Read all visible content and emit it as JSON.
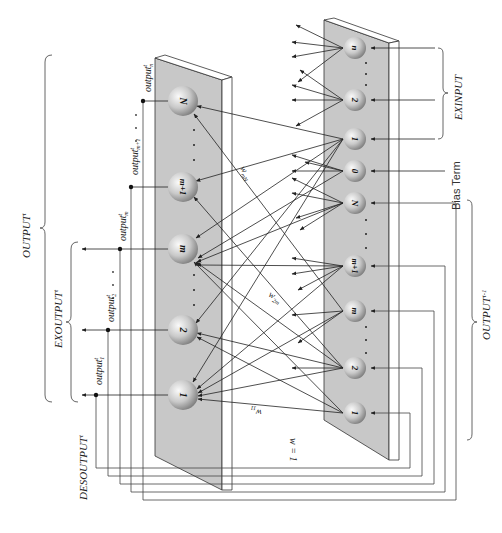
{
  "diagram": {
    "type": "recurrent-neural-network-schematic",
    "colors": {
      "panel_fill": "#c8c8c8",
      "panel_edge": "#333333",
      "node_fill_light": "#f4f4f4",
      "node_fill_dark": "#8c8c8c",
      "line": "#222222"
    },
    "labels": {
      "output_t": "OUTPUT",
      "output_t_sup": "t",
      "exoutput_t": "EXOUTPUT",
      "exoutput_t_sup": "t",
      "desoutput_t": "DESOUTPUT",
      "desoutput_t_sup": "t",
      "output_t_minus_1": "OUTPUT",
      "output_t_minus_1_sup": "t-1",
      "exinput": "EXINPUT",
      "bias_term": "Bias Term",
      "w_equals_1": "w = 1",
      "w_11": "w",
      "w_11_sub": "11",
      "w_2m": "w",
      "w_2m_sub": "2m",
      "w_mN": "w",
      "w_mN_sub": "mN"
    },
    "output_labels": [
      {
        "base": "output",
        "sup": "t",
        "sub": "n"
      },
      {
        "base": "output",
        "sup": "t",
        "sub": "m+1"
      },
      {
        "base": "output",
        "sup": "t",
        "sub": "m"
      },
      {
        "base": "output",
        "sup": "t",
        "sub": "2"
      },
      {
        "base": "output",
        "sup": "t",
        "sub": "1"
      }
    ],
    "output_layer_nodes": [
      {
        "label": "N"
      },
      {
        "label": "m+1"
      },
      {
        "label": "m"
      },
      {
        "label": "2"
      },
      {
        "label": "1"
      }
    ],
    "input_layer_nodes": [
      {
        "label": "n",
        "group": "EXINPUT"
      },
      {
        "label": "2",
        "group": "EXINPUT"
      },
      {
        "label": "1",
        "group": "EXINPUT"
      },
      {
        "label": "0",
        "group": "Bias Term"
      },
      {
        "label": "N",
        "group": "OUTPUT t-1"
      },
      {
        "label": "m+1",
        "group": "OUTPUT t-1"
      },
      {
        "label": "m",
        "group": "OUTPUT t-1"
      },
      {
        "label": "2",
        "group": "OUTPUT t-1"
      },
      {
        "label": "1",
        "group": "OUTPUT t-1"
      }
    ],
    "ellipsis": ". . ."
  }
}
